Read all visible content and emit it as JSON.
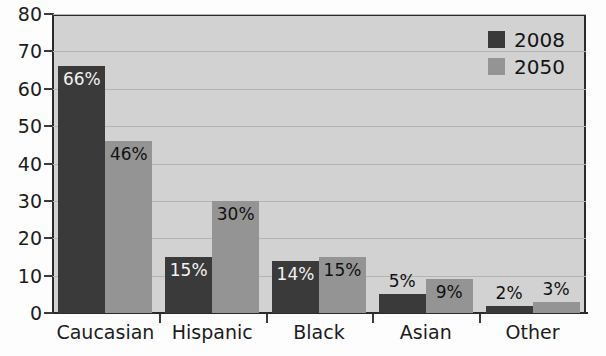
{
  "chart_data": {
    "type": "bar",
    "title": "",
    "xlabel": "",
    "ylabel": "",
    "categories": [
      "Caucasian",
      "Hispanic",
      "Black",
      "Asian",
      "Other"
    ],
    "series": [
      {
        "name": "2008",
        "color": "#3a3a3a",
        "values": [
          66,
          15,
          14,
          5,
          2
        ],
        "labels": [
          "66%",
          "15%",
          "14%",
          "5%",
          "2%"
        ]
      },
      {
        "name": "2050",
        "color": "#949494",
        "values": [
          46,
          30,
          15,
          9,
          3
        ],
        "labels": [
          "46%",
          "30%",
          "15%",
          "9%",
          "3%"
        ]
      }
    ],
    "ylim": [
      0,
      80
    ],
    "yticks": [
      0,
      10,
      20,
      30,
      40,
      50,
      60,
      70,
      80
    ],
    "ytick_labels": [
      "0",
      "10",
      "20",
      "30",
      "40",
      "50",
      "60",
      "70",
      "80"
    ],
    "grid": true,
    "legend_position": "top-right",
    "plot_background": "#d2d2d2",
    "gridline_color": "#b4b4b4",
    "axis_color": "#2b2b2b"
  }
}
